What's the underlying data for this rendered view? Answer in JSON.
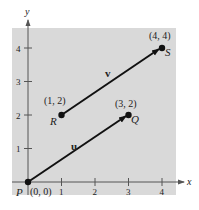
{
  "diagram": {
    "axes": {
      "x_label": "x",
      "y_label": "y",
      "x_ticks": [
        "1",
        "2",
        "3",
        "4"
      ],
      "y_ticks": [
        "1",
        "2",
        "3",
        "4"
      ]
    },
    "points": [
      {
        "name": "P",
        "coord_label": "(0, 0)",
        "x": 0,
        "y": 0
      },
      {
        "name": "Q",
        "coord_label": "(3, 2)",
        "x": 3,
        "y": 2
      },
      {
        "name": "R",
        "coord_label": "(1, 2)",
        "x": 1,
        "y": 2
      },
      {
        "name": "S",
        "coord_label": "(4, 4)",
        "x": 4,
        "y": 4
      }
    ],
    "vectors": [
      {
        "name": "u",
        "from": "P",
        "to": "Q"
      },
      {
        "name": "v",
        "from": "R",
        "to": "S"
      }
    ],
    "colors": {
      "background_panel": "#d9d9d9",
      "ink": "#111111"
    }
  }
}
